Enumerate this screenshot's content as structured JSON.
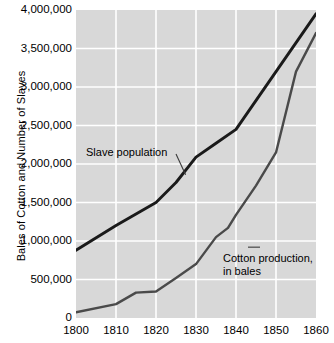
{
  "chart_data": {
    "type": "line",
    "title": "",
    "xlabel": "",
    "ylabel": "Bales of Cotton and Number of Slaves",
    "x": [
      1800,
      1810,
      1820,
      1830,
      1840,
      1850,
      1860
    ],
    "xlim": [
      1800,
      1860
    ],
    "ylim": [
      0,
      4000000
    ],
    "xtick_labels": [
      "1800",
      "1810",
      "1820",
      "1830",
      "1840",
      "1850",
      "1860"
    ],
    "ytick_labels": [
      "0",
      "500,000",
      "1,000,000",
      "1,500,000",
      "2,000,000",
      "2,500,000",
      "3,000,000",
      "3,500,000",
      "4,000,000"
    ],
    "ytick_values": [
      0,
      500000,
      1000000,
      1500000,
      2000000,
      2500000,
      3000000,
      3500000,
      4000000
    ],
    "grid": true,
    "legend_position": "inline-annotations",
    "plot_background": "#d8d8d8",
    "grid_color": "#ffffff",
    "series": [
      {
        "name": "Slave population",
        "color": "#1a1a1a",
        "width": 2.9,
        "points": [
          {
            "x": 1800,
            "y": 880000
          },
          {
            "x": 1810,
            "y": 1200000
          },
          {
            "x": 1815,
            "y": 1350000
          },
          {
            "x": 1820,
            "y": 1500000
          },
          {
            "x": 1825,
            "y": 1760000
          },
          {
            "x": 1830,
            "y": 2090000
          },
          {
            "x": 1835,
            "y": 2270000
          },
          {
            "x": 1840,
            "y": 2450000
          },
          {
            "x": 1850,
            "y": 3200000
          },
          {
            "x": 1860,
            "y": 3950000
          }
        ]
      },
      {
        "name": "Cotton production, in bales",
        "color": "#4a4a4a",
        "width": 2.4,
        "points": [
          {
            "x": 1800,
            "y": 75000
          },
          {
            "x": 1810,
            "y": 180000
          },
          {
            "x": 1815,
            "y": 330000
          },
          {
            "x": 1820,
            "y": 345000
          },
          {
            "x": 1825,
            "y": 520000
          },
          {
            "x": 1830,
            "y": 700000
          },
          {
            "x": 1835,
            "y": 1050000
          },
          {
            "x": 1838,
            "y": 1170000
          },
          {
            "x": 1840,
            "y": 1340000
          },
          {
            "x": 1845,
            "y": 1720000
          },
          {
            "x": 1850,
            "y": 2150000
          },
          {
            "x": 1855,
            "y": 3200000
          },
          {
            "x": 1860,
            "y": 3700000
          }
        ]
      }
    ],
    "annotations": [
      {
        "name": "slave-population",
        "text_lines": [
          "Slave population"
        ],
        "leader": {
          "from": [
            1825.0,
            2130000
          ],
          "to": [
            1827.4,
            1860000
          ]
        }
      },
      {
        "name": "cotton-production",
        "text_lines": [
          "Cotton production,",
          "in bales"
        ],
        "leader": {
          "from": [
            1843.0,
            920000
          ],
          "to": [
            1846.0,
            920000
          ]
        }
      }
    ]
  },
  "y_axis": {
    "title": "Bales of Cotton and Number of Slaves"
  },
  "annotations": {
    "slave_population": "Slave population",
    "cotton_production_line1": "Cotton production,",
    "cotton_production_line2": "in bales"
  }
}
